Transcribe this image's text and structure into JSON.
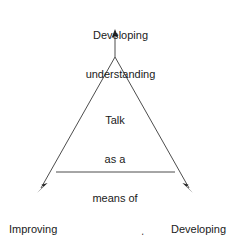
{
  "diagram": {
    "type": "triangle-concept-diagram",
    "title": "Talk as a means of assessment",
    "line_color": "#4d4d4d",
    "text_color": "#1a1a1a",
    "background_color": "#ffffff",
    "center": {
      "name": "center-label",
      "lines": [
        "Talk",
        "as a",
        "means of",
        "assessment"
      ],
      "line1": "Talk",
      "line2": "as a",
      "line3": "means of",
      "line4": "assessment"
    },
    "vertices": [
      {
        "id": "top",
        "label": "Developing understanding",
        "line1": "Developing",
        "line2": "understanding",
        "arrow_direction": "up"
      },
      {
        "id": "bottom-left",
        "label": "Improving language",
        "line1": "Improving",
        "line2": "language",
        "arrow_direction": "down-left"
      },
      {
        "id": "bottom-right",
        "label": "Developing social skills",
        "line1": "Developing",
        "line2": "social skills",
        "arrow_direction": "down-right"
      }
    ]
  }
}
